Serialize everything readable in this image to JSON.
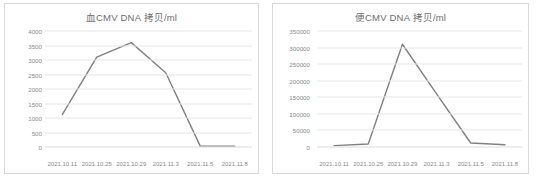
{
  "page": {
    "background": "#ffffff",
    "line_color": "#808080",
    "grid_color": "#e6e6e6",
    "text_color": "#8a8a8a"
  },
  "charts": [
    {
      "id": "blood-cmv-dna",
      "title": "血CMV DNA 拷贝/ml",
      "chart_data": {
        "type": "line",
        "title": "血CMV DNA 拷贝/ml",
        "xlabel": "",
        "ylabel": "",
        "categories": [
          "2021.10.11",
          "2021.10.25",
          "2021.10.29",
          "2021.11.3",
          "2021.11.5",
          "2021.11.8"
        ],
        "values": [
          1120,
          3100,
          3600,
          2560,
          30,
          30
        ],
        "yticks": [
          0,
          500,
          1000,
          1500,
          2000,
          2500,
          3000,
          3500,
          4000
        ],
        "ytick_labels": [
          "0",
          "500",
          "1000",
          "1500",
          "2000",
          "2500",
          "3000",
          "3500",
          "4000"
        ],
        "ylim": [
          0,
          4000
        ],
        "grid": true,
        "legend": false,
        "series": [
          {
            "name": "血CMV DNA 拷贝/ml",
            "values": [
              1120,
              3100,
              3600,
              2560,
              30,
              30
            ]
          }
        ]
      }
    },
    {
      "id": "stool-cmv-dna",
      "title": "便CMV DNA 拷贝/ml",
      "chart_data": {
        "type": "line",
        "title": "便CMV DNA 拷贝/ml",
        "xlabel": "",
        "ylabel": "",
        "categories": [
          "2021.10.11",
          "2021.10.25",
          "2021.10.29",
          "2021.11.3",
          "2021.11.5",
          "2021.11.8"
        ],
        "values": [
          4000,
          9000,
          310000,
          160000,
          12000,
          7000
        ],
        "yticks": [
          0,
          50000,
          100000,
          150000,
          200000,
          250000,
          300000,
          350000
        ],
        "ytick_labels": [
          "0",
          "50000",
          "100000",
          "150000",
          "200000",
          "250000",
          "300000",
          "350000"
        ],
        "ylim": [
          0,
          350000
        ],
        "grid": true,
        "legend": false,
        "series": [
          {
            "name": "便CMV DNA 拷贝/ml",
            "values": [
              4000,
              9000,
              310000,
              160000,
              12000,
              7000
            ]
          }
        ]
      }
    }
  ]
}
